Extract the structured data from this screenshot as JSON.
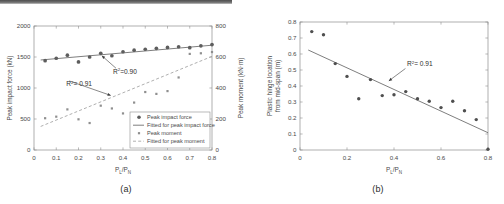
{
  "figure": {
    "panel_a_caption": "(a)",
    "panel_b_caption": "(b)"
  },
  "chart_data": [
    {
      "id": "panel-a",
      "type": "scatter",
      "title": "",
      "xlabel": "P_L/P_N",
      "xlabel_main": "P",
      "xlabel_sub1": "L",
      "xlabel_slash": "/P",
      "xlabel_sub2": "N",
      "ylabel": "Peak impact force (kN)",
      "ylabel_right": "Peak moment (kN·m)",
      "xlim": [
        0,
        0.8
      ],
      "ylim": [
        0,
        2000
      ],
      "ylim_right": [
        0,
        800
      ],
      "xticks": [
        0,
        0.1,
        0.2,
        0.3,
        0.4,
        0.5,
        0.6,
        0.7,
        0.8
      ],
      "xticklabels": [
        "0",
        "0.1",
        "0.2",
        "0.3",
        "0.4",
        "0.5",
        "0.6",
        "0.7",
        "0.8"
      ],
      "yticks": [
        0,
        500,
        1000,
        1500,
        2000
      ],
      "yticklabels": [
        "0",
        "500",
        "1000",
        "1500",
        "2000"
      ],
      "yticks_right": [
        0,
        200,
        400,
        600,
        800
      ],
      "yticklabels_right": [
        "0",
        "200",
        "400",
        "600",
        "800"
      ],
      "grid": false,
      "legend_position": "lower right",
      "annotations": [
        {
          "text_main": "R",
          "text_sup": "2",
          "text_rest": "=0.90",
          "x": 0.355,
          "y": 1230,
          "arrow_to_x": 0.305,
          "arrow_to_y": 1520
        },
        {
          "text_main": "R",
          "text_sup": "2",
          "text_rest": "= 0.91",
          "x": 0.145,
          "y": 1025,
          "arrow_to_x": 0.345,
          "arrow_to_y": 880
        }
      ],
      "series": [
        {
          "name": "Peak impact force",
          "marker": "filled-circle",
          "axis": "left",
          "x": [
            0.05,
            0.1,
            0.15,
            0.2,
            0.25,
            0.3,
            0.35,
            0.4,
            0.45,
            0.5,
            0.55,
            0.6,
            0.65,
            0.7,
            0.75,
            0.8
          ],
          "values": [
            1440,
            1480,
            1530,
            1420,
            1500,
            1560,
            1520,
            1585,
            1610,
            1625,
            1640,
            1655,
            1665,
            1650,
            1680,
            1700
          ]
        },
        {
          "name": "Fitted for peak impact force",
          "marker": "solid-line",
          "axis": "left",
          "x": [
            0.03,
            0.8
          ],
          "values": [
            1452,
            1690
          ]
        },
        {
          "name": "Peak moment",
          "marker": "small-square",
          "axis": "right",
          "x": [
            0.05,
            0.1,
            0.15,
            0.2,
            0.25,
            0.3,
            0.35,
            0.4,
            0.45,
            0.5,
            0.55,
            0.6,
            0.65,
            0.7,
            0.75,
            0.8
          ],
          "values": [
            205,
            215,
            262,
            198,
            174,
            286,
            268,
            236,
            306,
            374,
            362,
            380,
            468,
            620,
            624,
            632
          ]
        },
        {
          "name": "Fitted for peak moment",
          "marker": "dashed-line",
          "axis": "right",
          "x": [
            0.03,
            0.8
          ],
          "values": [
            152,
            604
          ]
        }
      ],
      "legend": [
        {
          "label": "Peak impact force",
          "marker": "filled-circle"
        },
        {
          "label": "Fitted for peak impact force",
          "marker": "solid-line"
        },
        {
          "label": "Peak moment",
          "marker": "small-square"
        },
        {
          "label": "Fitted for peak moment",
          "marker": "dashed-line"
        }
      ]
    },
    {
      "id": "panel-b",
      "type": "scatter",
      "title": "",
      "xlabel": "P_L/P_N",
      "xlabel_main": "P",
      "xlabel_sub1": "L",
      "xlabel_slash": "/P",
      "xlabel_sub2": "N",
      "ylabel_line1": "Plastic hinge location",
      "ylabel_line2": "from mid-span (m)",
      "xlim": [
        0,
        0.8
      ],
      "ylim": [
        0,
        0.8
      ],
      "xticks": [
        0,
        0.2,
        0.4,
        0.6,
        0.8
      ],
      "xticklabels": [
        "0",
        "0.2",
        "0.4",
        "0.6",
        "0.8"
      ],
      "yticks": [
        0,
        0.1,
        0.2,
        0.3,
        0.4,
        0.5,
        0.6,
        0.7,
        0.8
      ],
      "yticklabels": [
        "0",
        "0.1",
        "0.2",
        "0.3",
        "0.4",
        "0.5",
        "0.6",
        "0.7",
        "0.8"
      ],
      "grid": false,
      "legend_position": "none",
      "annotations": [
        {
          "text_main": "R",
          "text_sup": "2",
          "text_rest": "= 0.91",
          "x": 0.455,
          "y": 0.525,
          "arrow_to_x": 0.378,
          "arrow_to_y": 0.432
        }
      ],
      "series": [
        {
          "name": "Plastic hinge location",
          "marker": "filled-circle",
          "axis": "left",
          "x": [
            0.05,
            0.1,
            0.15,
            0.2,
            0.25,
            0.3,
            0.35,
            0.4,
            0.45,
            0.5,
            0.55,
            0.6,
            0.65,
            0.7,
            0.75,
            0.8
          ],
          "values": [
            0.74,
            0.72,
            0.54,
            0.46,
            0.32,
            0.44,
            0.34,
            0.345,
            0.365,
            0.32,
            0.305,
            0.265,
            0.305,
            0.245,
            0.19,
            0.005
          ]
        },
        {
          "name": "Fitted line",
          "marker": "solid-line",
          "axis": "left",
          "x": [
            0.035,
            0.8
          ],
          "values": [
            0.625,
            0.108
          ]
        }
      ],
      "legend": []
    }
  ],
  "colors": {
    "point_force": "#5d5d5d",
    "point_moment": "#8f8f8f",
    "point_hinge": "#4f4f4f",
    "fit_solid": "#6f6f6f",
    "fit_dashed": "#9a9a9a",
    "axis": "#8d8d8d",
    "text": "#4a4a4a",
    "background": "#ffffff"
  }
}
